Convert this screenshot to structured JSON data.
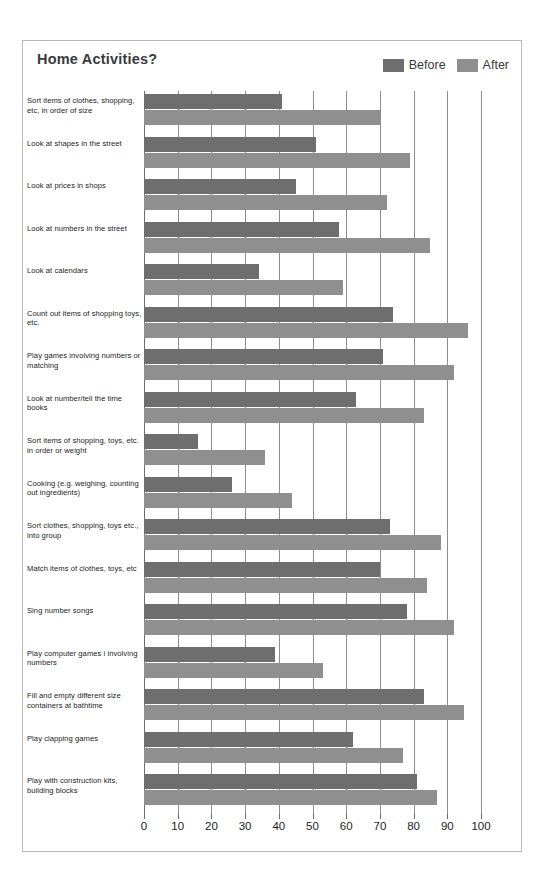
{
  "chart_data": {
    "type": "bar",
    "orientation": "horizontal",
    "title": "Home Activities?",
    "xlabel": "",
    "ylabel": "",
    "xlim": [
      0,
      100
    ],
    "xticks": [
      0,
      10,
      20,
      30,
      40,
      50,
      60,
      70,
      80,
      90,
      100
    ],
    "grid": true,
    "legend_position": "top-right",
    "colors": {
      "before": "#6e6e6e",
      "after": "#8f8f8f"
    },
    "categories": [
      "Sort items of clothes, shopping, etc, in order of size",
      "Look at shapes in the street",
      "Look at prices in shops",
      "Look at numbers in the street",
      "Look at calendars",
      "Count out items of shopping toys, etc.",
      "Play games involving numbers or matching",
      "Look at number/tell the time books",
      "Sort items of shopping, toys, etc. in order or weight",
      "Cooking (e.g. weighing, counting out ingredients)",
      "Sort clothes, shopping, toys etc., into group",
      "Match items of clothes, toys, etc",
      "Sing number songs",
      "Play computer games i involving numbers",
      "Fill and empty different size containers at bathtime",
      "Play clapping games",
      "Play with construction kits, building blocks"
    ],
    "series": [
      {
        "name": "Before",
        "values": [
          41,
          51,
          45,
          58,
          34,
          74,
          71,
          63,
          16,
          26,
          73,
          70,
          78,
          39,
          83,
          62,
          81
        ]
      },
      {
        "name": "After",
        "values": [
          70,
          79,
          72,
          85,
          59,
          96,
          92,
          83,
          36,
          44,
          88,
          84,
          92,
          53,
          95,
          77,
          87
        ]
      }
    ]
  },
  "legend": {
    "items": [
      {
        "label": "Before",
        "color": "#6e6e6e"
      },
      {
        "label": "After",
        "color": "#8f8f8f"
      }
    ]
  }
}
